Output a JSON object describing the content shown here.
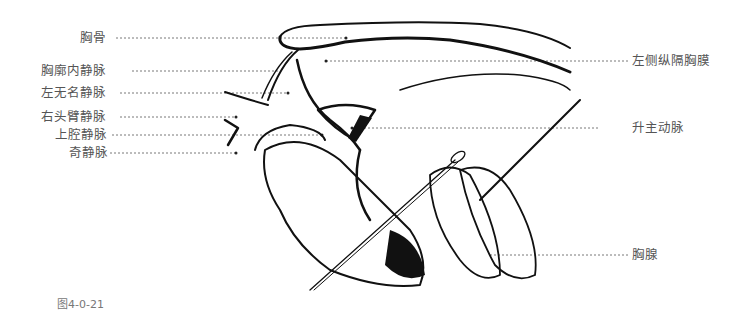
{
  "figure": {
    "caption": "图4-0-21",
    "labels_left": [
      {
        "text": "胸骨",
        "y": 38
      },
      {
        "text": "胸廓内静脉",
        "y": 71
      },
      {
        "text": "左无名静脉",
        "y": 93
      },
      {
        "text": "右头臂静脉",
        "y": 117
      },
      {
        "text": "上腔静脉",
        "y": 135
      },
      {
        "text": "奇静脉",
        "y": 153
      }
    ],
    "labels_right": [
      {
        "text": "左侧纵隔胸膜",
        "y": 61
      },
      {
        "text": "升主动脉",
        "y": 128
      },
      {
        "text": "胸腺",
        "y": 255
      }
    ]
  }
}
